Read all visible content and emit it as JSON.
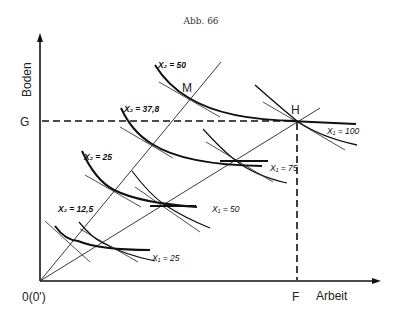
{
  "figure": {
    "caption": "Abb. 66",
    "y_axis_label": "Boden",
    "x_axis_label": "Arbeit",
    "origin_label": "0(0')",
    "point_G": "G",
    "point_F": "F",
    "point_H": "H",
    "point_M": "M"
  },
  "isoquants_x2": [
    {
      "label": "X₂ = 12,5"
    },
    {
      "label": "X₂ = 25"
    },
    {
      "label": "X₂ = 37,8"
    },
    {
      "label": "X₂ = 50"
    }
  ],
  "isoquants_x1": [
    {
      "label": "X₁ = 25"
    },
    {
      "label": "X₁ = 50"
    },
    {
      "label": "X₁ = 75"
    },
    {
      "label": "X₁ = 100"
    }
  ]
}
